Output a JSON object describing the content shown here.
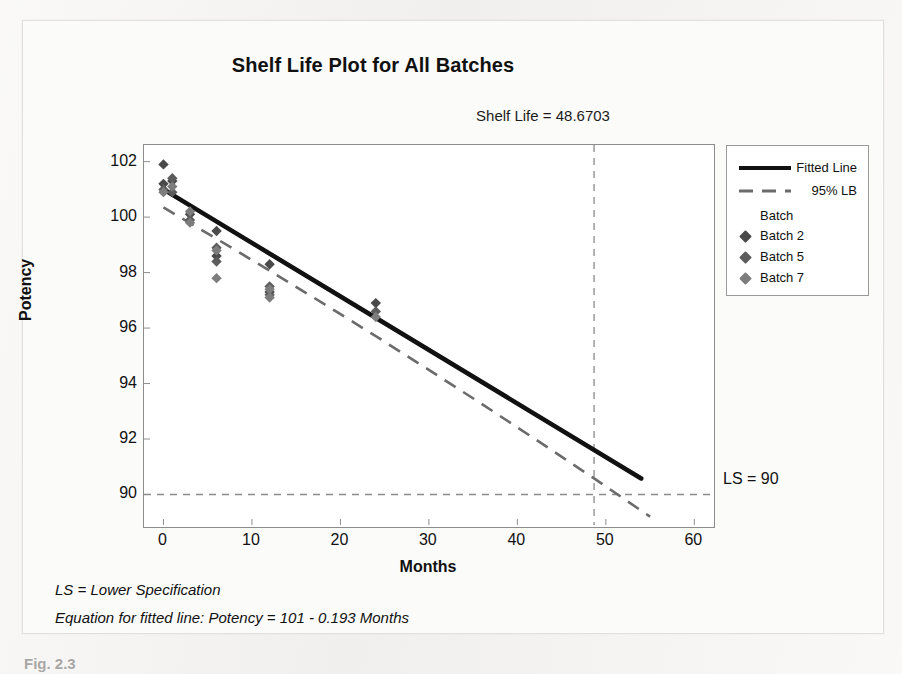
{
  "figure": {
    "title": "Shelf Life Plot for All Batches",
    "shelf_life_annotation": "Shelf Life = 48.6703",
    "ls_label": "LS = 90",
    "footnote_1": "LS = Lower Specification",
    "footnote_2": "Equation for fitted line: Potency = 101 - 0.193 Months",
    "caption": "Fig. 2.3"
  },
  "legend": {
    "fitted_line": "Fitted Line",
    "lower_bound": "95% LB",
    "group_header": "Batch",
    "batches": [
      "Batch 2",
      "Batch 5",
      "Batch 7"
    ]
  },
  "colors": {
    "fitted_line": "#111111",
    "lower_bound": "#6b6b6b",
    "reference_line": "#8a8a8a",
    "batch_2": "#4a4a4a",
    "batch_5": "#5c5c5c",
    "batch_7": "#7d7d7d",
    "frame": "#8d8d8d",
    "plot_background": "#ffffff"
  },
  "chart_data": {
    "type": "scatter",
    "title": "Shelf Life Plot for All Batches",
    "xlabel": "Months",
    "ylabel": "Potency",
    "xlim": [
      -2.2,
      62
    ],
    "ylim": [
      88.9,
      102.6
    ],
    "xticks": [
      0,
      10,
      20,
      30,
      40,
      50,
      60
    ],
    "yticks": [
      90,
      92,
      94,
      96,
      98,
      100,
      102
    ],
    "grid": false,
    "legend_position": "right-outside",
    "annotations": [
      {
        "text": "Shelf Life = 48.6703",
        "x": 48.6703,
        "y": 102.6,
        "position": "above-plot"
      },
      {
        "text": "LS = 90",
        "x": 62,
        "y": 90,
        "position": "right-of-plot"
      }
    ],
    "reference_lines": [
      {
        "name": "shelf-life",
        "orientation": "vertical",
        "value": 48.6703,
        "style": "dashed"
      },
      {
        "name": "lower-specification",
        "orientation": "horizontal",
        "value": 90,
        "style": "dashed"
      }
    ],
    "fit": {
      "name": "Fitted Line",
      "equation": "Potency = 101 - 0.193 Months",
      "intercept": 101.0,
      "slope": -0.193,
      "x_range": [
        0,
        54
      ],
      "style": "solid"
    },
    "lower_bound": {
      "name": "95% LB",
      "style": "dashed",
      "x_range": [
        0,
        55
      ],
      "points": [
        {
          "x": 0,
          "y": 100.35
        },
        {
          "x": 6,
          "y": 99.22
        },
        {
          "x": 12,
          "y": 98.07
        },
        {
          "x": 18,
          "y": 96.9
        },
        {
          "x": 24,
          "y": 95.71
        },
        {
          "x": 30,
          "y": 94.49
        },
        {
          "x": 36,
          "y": 93.26
        },
        {
          "x": 42,
          "y": 92.0
        },
        {
          "x": 48.6703,
          "y": 90.58
        },
        {
          "x": 55,
          "y": 89.2
        }
      ]
    },
    "series": [
      {
        "name": "Batch 2",
        "marker": "diamond",
        "points": [
          {
            "x": 0,
            "y": 101.9
          },
          {
            "x": 0,
            "y": 101.2
          },
          {
            "x": 1,
            "y": 101.3
          },
          {
            "x": 3,
            "y": 100.1
          },
          {
            "x": 6,
            "y": 99.5
          },
          {
            "x": 6,
            "y": 98.6
          },
          {
            "x": 12,
            "y": 98.3
          },
          {
            "x": 12,
            "y": 97.3
          },
          {
            "x": 24,
            "y": 96.9
          }
        ]
      },
      {
        "name": "Batch 5",
        "marker": "diamond",
        "points": [
          {
            "x": 0,
            "y": 101.0
          },
          {
            "x": 1,
            "y": 101.4
          },
          {
            "x": 1,
            "y": 100.9
          },
          {
            "x": 3,
            "y": 99.9
          },
          {
            "x": 6,
            "y": 98.9
          },
          {
            "x": 6,
            "y": 98.4
          },
          {
            "x": 12,
            "y": 97.5
          },
          {
            "x": 12,
            "y": 97.2
          },
          {
            "x": 24,
            "y": 96.6
          }
        ]
      },
      {
        "name": "Batch 7",
        "marker": "diamond",
        "points": [
          {
            "x": 0,
            "y": 100.9
          },
          {
            "x": 1,
            "y": 101.1
          },
          {
            "x": 3,
            "y": 99.8
          },
          {
            "x": 3,
            "y": 100.2
          },
          {
            "x": 6,
            "y": 98.8
          },
          {
            "x": 6,
            "y": 97.8
          },
          {
            "x": 12,
            "y": 97.4
          },
          {
            "x": 12,
            "y": 97.1
          },
          {
            "x": 24,
            "y": 96.4
          }
        ]
      }
    ]
  }
}
